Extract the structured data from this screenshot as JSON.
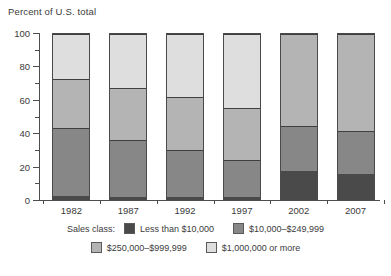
{
  "chart_data": {
    "type": "bar",
    "title": "",
    "ylabel": "Percent of U.S. total",
    "xlabel": "",
    "ylim": [
      0,
      100
    ],
    "yticks": [
      0,
      20,
      40,
      60,
      80,
      100
    ],
    "yticks_minor": [
      10,
      30,
      50,
      70,
      90
    ],
    "grid": false,
    "stacked": true,
    "stack_total": 100,
    "legend_position": "bottom",
    "legend_title": "Sales class:",
    "categories": [
      "1982",
      "1987",
      "1992",
      "1997",
      "2002",
      "2007"
    ],
    "series": [
      {
        "name": "Less than $10,000",
        "color": "#4a4a4a",
        "values": [
          2.0,
          1.5,
          1.5,
          1.5,
          17.0,
          15.0
        ]
      },
      {
        "name": "$10,000–$249,999",
        "color": "#878787",
        "values": [
          41.0,
          34.5,
          28.5,
          22.0,
          27.0,
          26.0
        ]
      },
      {
        "name": "$250,000–$999,999",
        "color": "#b4b4b4",
        "values": [
          30.0,
          31.0,
          32.0,
          31.5,
          56.0,
          59.0
        ]
      },
      {
        "name": "$1,000,000 or more",
        "color": "#dedede",
        "values": [
          27.0,
          33.0,
          38.0,
          45.0,
          0.0,
          0.0
        ]
      }
    ],
    "cumulative_boundaries": {
      "1982": [
        2.0,
        43.0,
        73.0,
        100.0
      ],
      "1987": [
        1.5,
        36.0,
        67.0,
        100.0
      ],
      "1992": [
        1.5,
        30.0,
        62.0,
        100.0
      ],
      "1997": [
        1.5,
        23.5,
        55.0,
        100.0
      ],
      "2002": [
        17.0,
        44.0,
        100.0,
        100.0
      ],
      "2007": [
        15.0,
        41.0,
        100.0,
        100.0
      ]
    }
  },
  "axis": {
    "y_title": "Percent of U.S. total"
  },
  "legend": {
    "title": "Sales class:",
    "items": [
      {
        "label": "Less than $10,000"
      },
      {
        "label": "$10,000–$249,999"
      },
      {
        "label": "$250,000–$999,999"
      },
      {
        "label": "$1,000,000 or more"
      }
    ]
  }
}
